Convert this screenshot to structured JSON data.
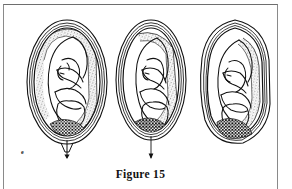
{
  "figure": {
    "caption": "Figure 15",
    "panel_label": "e",
    "ink_color": "#111111",
    "background_color": "#ffffff",
    "frame_color": "#8a8a8a",
    "stipple_color": "#3a3a3a",
    "border_present": true
  },
  "illustration": {
    "subject": "fetus in utero, three successive stages of descent",
    "style": "line drawing with stippled shading",
    "panel_count": 3,
    "panels": [
      {
        "index": 1,
        "name": "uterus-upright-oval",
        "description": "Upright ovoid uterus with fetus in cephalic presentation, placenta stippled along upper and right wall, cervix closed with short downward arrow",
        "cervix_marker": "short-arrow",
        "orientation_deg": 0
      },
      {
        "index": 2,
        "name": "uterus-narrowing-oval",
        "description": "Uterus drawn narrower, fetal head lower in the pelvis, placenta stippled along right wall, long downward arrow at cervix",
        "cervix_marker": "long-arrow",
        "orientation_deg": 0
      },
      {
        "index": 3,
        "name": "uterus-tilted-irregular",
        "description": "Uterus tilted and irregular in outline, fetal head fully engaged and emerging at lower pole, no arrow shown",
        "cervix_marker": "none",
        "orientation_deg": -10
      }
    ],
    "anatomy_labels": [
      "uterine wall",
      "amniotic sac",
      "placenta",
      "fetus",
      "fetal head",
      "cervix"
    ]
  }
}
